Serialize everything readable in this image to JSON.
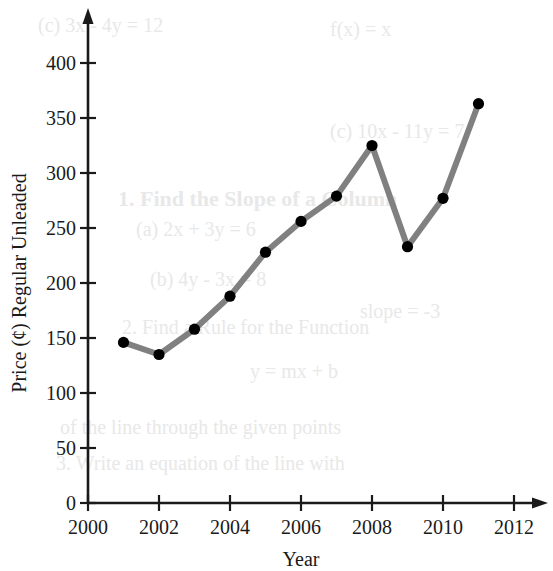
{
  "chart_data": {
    "type": "line",
    "title": "",
    "xlabel": "Year",
    "ylabel": "Price (¢) Regular Unleaded",
    "xlim": [
      2000,
      2013
    ],
    "ylim": [
      0,
      430
    ],
    "xticks": [
      2000,
      2002,
      2004,
      2006,
      2008,
      2010,
      2012
    ],
    "xtick_labels": [
      "2000",
      "2002",
      "2004",
      "2006",
      "2008",
      "2010",
      "2012"
    ],
    "yticks": [
      0,
      50,
      100,
      150,
      200,
      250,
      300,
      350,
      400
    ],
    "ytick_labels": [
      "0",
      "50",
      "100",
      "150",
      "200",
      "250",
      "300",
      "350",
      "400"
    ],
    "grid": false,
    "legend": "none",
    "line_color": "#808080",
    "marker_color": "#000000",
    "axis_color": "#000000",
    "x": [
      2001,
      2002,
      2003,
      2004,
      2005,
      2006,
      2007,
      2008,
      2009,
      2010,
      2011
    ],
    "values": [
      146,
      135,
      158,
      188,
      228,
      256,
      279,
      325,
      233,
      277,
      363
    ],
    "points": [
      {
        "x": 2001,
        "y": 146
      },
      {
        "x": 2002,
        "y": 135
      },
      {
        "x": 2003,
        "y": 158
      },
      {
        "x": 2004,
        "y": 188
      },
      {
        "x": 2005,
        "y": 228
      },
      {
        "x": 2006,
        "y": 256
      },
      {
        "x": 2007,
        "y": 279
      },
      {
        "x": 2008,
        "y": 325
      },
      {
        "x": 2009,
        "y": 233
      },
      {
        "x": 2010,
        "y": 277
      },
      {
        "x": 2011,
        "y": 363
      }
    ]
  },
  "background_text": {
    "lines": [
      "(c) 3x - 4y = 12",
      "f(x) = x",
      "1. Find the Slope of a Column",
      "(a) 2x + 3y = 6",
      "(c) 10x - 11y = 7",
      "(b) 4y - 3x = 8",
      "2. Find a Rule for the Function",
      "slope = -3",
      "y = mx + b",
      "of the line through the given points",
      "3. Write an equation of the line with"
    ]
  }
}
